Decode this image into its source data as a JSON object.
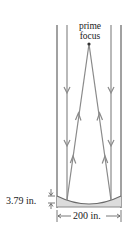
{
  "diagram": {
    "type": "telescope-parabolic-mirror",
    "labels": {
      "prime_focus_line1": "prime",
      "prime_focus_line2": "focus",
      "mirror_depth": "3.79 in.",
      "mirror_width": "200 in."
    },
    "colors": {
      "line": "#8a8a8a",
      "mirror_fill": "#dcdcdc",
      "text": "#222222",
      "focus_dot": "#333333"
    }
  }
}
